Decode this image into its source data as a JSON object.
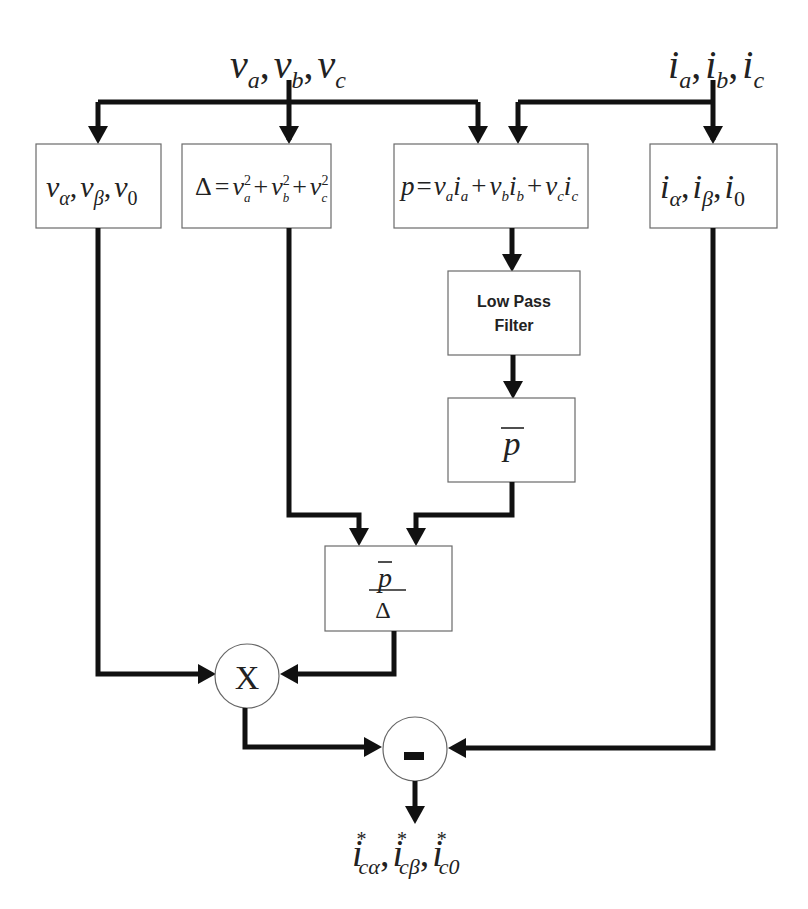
{
  "diagram": {
    "inputs": {
      "voltages": {
        "base": [
          "v",
          "v",
          "v"
        ],
        "subs": [
          "a",
          "b",
          "c"
        ]
      },
      "currents": {
        "base": [
          "i",
          "i",
          "i"
        ],
        "subs": [
          "a",
          "b",
          "c"
        ]
      }
    },
    "blocks": {
      "v_transform": {
        "base": "v",
        "subs": [
          "α",
          "β",
          "0"
        ]
      },
      "delta": {
        "lhs": "Δ",
        "eq": "=",
        "term": "v",
        "subs": [
          "a",
          "b",
          "c"
        ],
        "sup": "2",
        "plus": "+"
      },
      "power": {
        "lhs": "p",
        "eq": "=",
        "terms": [
          [
            "v",
            "a",
            "i",
            "a"
          ],
          [
            "v",
            "b",
            "i",
            "b"
          ],
          [
            "v",
            "c",
            "i",
            "c"
          ]
        ],
        "plus": "+"
      },
      "i_transform": {
        "base": "i",
        "subs": [
          "α",
          "β",
          "0"
        ]
      },
      "lpf": {
        "line1": "Low Pass",
        "line2": "Filter"
      },
      "p_bar": {
        "symbol": "p"
      },
      "ratio": {
        "numerator": "p",
        "denominator": "Δ"
      },
      "multiplier": {
        "symbol": "X"
      },
      "subtractor": {
        "symbol": "-"
      }
    },
    "output": {
      "base": "i",
      "sup": "*",
      "subs": [
        "cα",
        "cβ",
        "c0"
      ]
    },
    "comma": ","
  }
}
